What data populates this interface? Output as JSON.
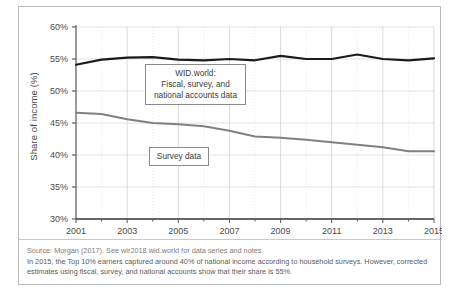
{
  "figure": {
    "y_axis_title": "Share of income (%)",
    "annotations": {
      "wid_line1": "WID.world:",
      "wid_line2": "Fiscal, survey, and",
      "wid_line3": "national accounts data",
      "survey": "Survey data"
    },
    "caption": {
      "line1": "Source: Morgan (2017). See wir2018.wid.world for data series and notes.",
      "line2": "In 2015, the Top 10% earners captured around 40% of national income according to household surveys. However, corrected",
      "line3": "estimates using fiscal, survey, and national accounts show that their share is 55%."
    }
  },
  "chart_data": {
    "type": "line",
    "title": "",
    "xlabel": "",
    "ylabel": "Share of income (%)",
    "xlim": [
      2001,
      2015
    ],
    "ylim": [
      30,
      60
    ],
    "y_ticks": [
      "30%",
      "35%",
      "40%",
      "45%",
      "50%",
      "55%",
      "60%"
    ],
    "y_tick_values": [
      30,
      35,
      40,
      45,
      50,
      55,
      60
    ],
    "x_ticks": [
      "2001",
      "2003",
      "2005",
      "2007",
      "2009",
      "2011",
      "2013",
      "2015"
    ],
    "x_tick_values": [
      2001,
      2003,
      2005,
      2007,
      2009,
      2011,
      2013,
      2015
    ],
    "x": [
      2001,
      2002,
      2003,
      2004,
      2005,
      2006,
      2007,
      2008,
      2009,
      2010,
      2011,
      2012,
      2013,
      2014,
      2015
    ],
    "grid": true,
    "legend_position": "inline-annotations",
    "series": [
      {
        "name": "WID.world: Fiscal, survey, and national accounts data",
        "color": "#1a1a1a",
        "width": 2.2,
        "values": [
          54.1,
          54.9,
          55.2,
          55.3,
          54.9,
          54.8,
          55.0,
          54.8,
          55.5,
          55.0,
          55.0,
          55.7,
          55.0,
          54.8,
          55.1
        ]
      },
      {
        "name": "Survey data",
        "color": "#808080",
        "width": 2.0,
        "values": [
          46.6,
          46.4,
          45.6,
          45.0,
          44.8,
          44.5,
          43.8,
          42.9,
          42.7,
          42.4,
          42.0,
          41.6,
          41.2,
          40.6,
          40.6
        ]
      }
    ]
  }
}
